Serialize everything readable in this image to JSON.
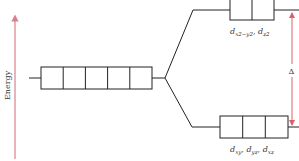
{
  "diagram": {
    "axis": {
      "label": "Energy",
      "color": "#d9808a"
    },
    "levels": {
      "degenerate": {
        "cells": 5,
        "label": ""
      },
      "upper": {
        "cells": 2,
        "label_main": "d",
        "label_parts": [
          {
            "base": "d",
            "sub": "x2−y2"
          },
          {
            "sep": ", "
          },
          {
            "base": "d",
            "sub": "z2"
          }
        ],
        "text": "d_{x²−y²}, d_{z²}"
      },
      "lower": {
        "cells": 3,
        "label_parts": [
          {
            "base": "d",
            "sub": "xy"
          },
          {
            "sep": ", "
          },
          {
            "base": "d",
            "sub": "yz"
          },
          {
            "sep": ", "
          },
          {
            "base": "d",
            "sub": "xz"
          }
        ],
        "text": "d_{xy}, d_{yz}, d_{xz}"
      }
    },
    "splitting": {
      "symbol": "Δ",
      "color": "#d9606a"
    },
    "line_color": "#222222"
  },
  "labels": {
    "energy": "Energy",
    "delta": "Δ",
    "upper_d1": "d",
    "upper_sub1": "x2−y2",
    "upper_sep": ", ",
    "upper_d2": "d",
    "upper_sub2": "z2",
    "lower_d1": "d",
    "lower_sub1": "xy",
    "lower_sep1": ", ",
    "lower_d2": "d",
    "lower_sub2": "yz",
    "lower_sep2": ", ",
    "lower_d3": "d",
    "lower_sub3": "xz"
  }
}
